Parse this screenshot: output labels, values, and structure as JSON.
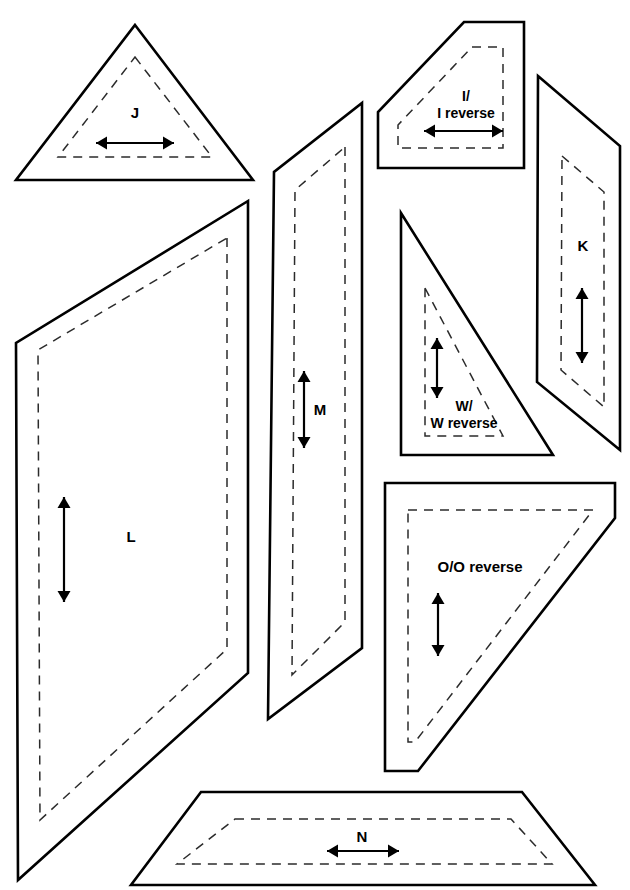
{
  "document": {
    "type": "sewing-pattern-sheet",
    "title": "Pattern piece layout sheet",
    "background_color": "#ffffff",
    "cut_line_color": "#000000",
    "seam_line_color": "#2b2b2b",
    "width": 630,
    "height": 890
  },
  "pieces": [
    {
      "id": "J",
      "label": "J",
      "label_lines": [
        "J"
      ],
      "shape": "triangle",
      "grain_direction": "horizontal",
      "label_x": 135,
      "label_y": 114,
      "cut_points": "135,25 253,180 16,180",
      "seam_points": "135,57 212,157 58,157",
      "grain": {
        "x1": 96,
        "y1": 143,
        "x2": 174,
        "y2": 143,
        "orientation": "horizontal"
      }
    },
    {
      "id": "I",
      "label": "I/ I reverse",
      "label_lines": [
        "I/",
        "I reverse"
      ],
      "shape": "trapezoid-bevel",
      "grain_direction": "horizontal",
      "label_x": 466,
      "label_y": 105,
      "cut_points": "464,22 524,22 524,168 378,168 378,112",
      "seam_points": "472,47 503,47 503,148 398,148 398,125",
      "grain": {
        "x1": 424,
        "y1": 131,
        "x2": 503,
        "y2": 131,
        "orientation": "horizontal"
      }
    },
    {
      "id": "K",
      "label": "K",
      "label_lines": [
        "K"
      ],
      "shape": "parallelogram",
      "grain_direction": "vertical",
      "label_x": 583,
      "label_y": 247,
      "cut_points": "538,76 620,146 620,450 537,382",
      "seam_points": "562,156 604,192 604,407 561,370",
      "grain": {
        "x1": 582,
        "y1": 288,
        "x2": 582,
        "y2": 363,
        "orientation": "vertical"
      }
    },
    {
      "id": "L",
      "label": "L",
      "label_lines": [
        "L"
      ],
      "shape": "quadrilateral",
      "grain_direction": "vertical",
      "label_x": 131,
      "label_y": 538,
      "cut_points": "248,201 248,673 18,880 16,343",
      "seam_points": "227,238 227,649 40,820 38,350",
      "grain": {
        "x1": 64,
        "y1": 497,
        "x2": 64,
        "y2": 602,
        "orientation": "vertical"
      }
    },
    {
      "id": "M",
      "label": "M",
      "label_lines": [
        "M"
      ],
      "shape": "parallelogram",
      "grain_direction": "vertical",
      "label_x": 320,
      "label_y": 411,
      "cut_points": "362,103 362,648 268,719 274,172",
      "seam_points": "345,147 345,622 292,675 295,190",
      "grain": {
        "x1": 304,
        "y1": 371,
        "x2": 304,
        "y2": 448,
        "orientation": "vertical"
      }
    },
    {
      "id": "N",
      "label": "N",
      "label_lines": [
        "N"
      ],
      "shape": "trapezoid",
      "grain_direction": "horizontal",
      "label_x": 362,
      "label_y": 838,
      "cut_points": "201,792 522,792 595,885 131,885",
      "seam_points": "235,819 511,819 552,864 177,864",
      "grain": {
        "x1": 327,
        "y1": 851,
        "x2": 399,
        "y2": 851,
        "orientation": "horizontal"
      }
    },
    {
      "id": "O",
      "label": "O/O reverse",
      "label_lines": [
        "O/O reverse"
      ],
      "shape": "right-triangle-clipped",
      "grain_direction": "vertical",
      "label_x": 480,
      "label_y": 568,
      "cut_points": "385,483 615,483 615,518 418,771 385,771",
      "seam_points": "408,510 593,510 415,742 408,742",
      "grain": {
        "x1": 438,
        "y1": 593,
        "x2": 438,
        "y2": 656,
        "orientation": "vertical"
      }
    },
    {
      "id": "W",
      "label": "W/ W reverse",
      "label_lines": [
        "W/",
        "W reverse"
      ],
      "shape": "right-triangle",
      "grain_direction": "vertical",
      "label_x": 464,
      "label_y": 415,
      "cut_points": "401,213 553,455 401,455",
      "seam_points": "425,288 503,436 425,436",
      "grain": {
        "x1": 437,
        "y1": 338,
        "x2": 437,
        "y2": 398,
        "orientation": "vertical"
      }
    }
  ]
}
